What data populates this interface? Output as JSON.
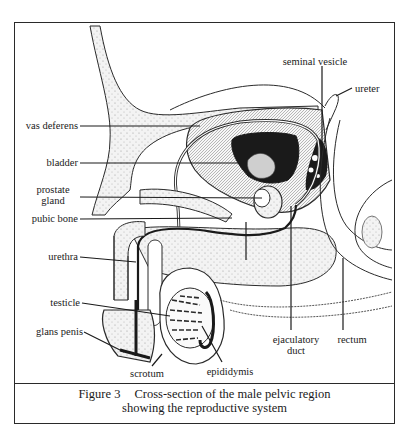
{
  "figure": {
    "number": "Figure 3",
    "caption_line1": "Cross-section of the male pelvic region",
    "caption_line2": "showing the reproductive system"
  },
  "labels": {
    "seminal_vesicle": "seminal vesicle",
    "ureter": "ureter",
    "vas_deferens": "vas deferens",
    "bladder": "bladder",
    "prostate_gland_line1": "prostate",
    "prostate_gland_line2": "gland",
    "pubic_bone": "pubic bone",
    "urethra": "urethra",
    "testicle": "testicle",
    "glans_penis": "glans penis",
    "scrotum": "scrotum",
    "epididymis": "epididymis",
    "ejaculatory_duct_line1": "ejaculatory",
    "ejaculatory_duct_line2": "duct",
    "rectum": "rectum"
  },
  "colors": {
    "ink": "#1a1a1a",
    "stipple": "#9a9a9a",
    "tissue_fill": "#ededed",
    "background": "#ffffff"
  }
}
